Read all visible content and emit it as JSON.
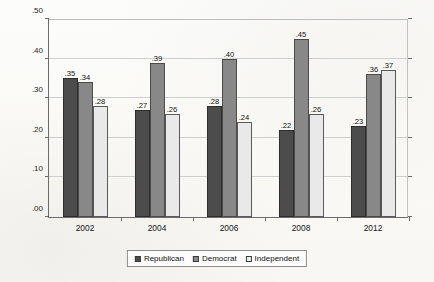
{
  "chart_data": {
    "type": "bar",
    "title": "",
    "xlabel": "",
    "ylabel": "Percent watching \"regularly\"",
    "categories": [
      "2002",
      "2004",
      "2006",
      "2008",
      "2012"
    ],
    "series": [
      {
        "name": "Republican",
        "color": "#4c4c4c",
        "values": [
          0.35,
          0.27,
          0.28,
          0.22,
          0.23
        ],
        "labels": [
          ".35",
          ".27",
          ".28",
          ".22",
          ".23"
        ]
      },
      {
        "name": "Democrat",
        "color": "#888888",
        "values": [
          0.34,
          0.39,
          0.4,
          0.45,
          0.36
        ],
        "labels": [
          ".34",
          ".39",
          ".40",
          ".45",
          ".36"
        ]
      },
      {
        "name": "Independent",
        "color": "#e9e9e9",
        "values": [
          0.28,
          0.26,
          0.24,
          0.26,
          0.37
        ],
        "labels": [
          ".28",
          ".26",
          ".24",
          ".26",
          ".37"
        ]
      }
    ],
    "ylim": [
      0.0,
      0.5
    ],
    "ytick_values": [
      0.0,
      0.1,
      0.2,
      0.3,
      0.4,
      0.5
    ],
    "ytick_labels": [
      ".00",
      ".10",
      ".20",
      ".30",
      ".40",
      ".50"
    ],
    "grid": true,
    "legend_position": "bottom-center"
  },
  "legend": {
    "items": [
      {
        "label": "Republican",
        "swatch": "series-republican"
      },
      {
        "label": "Democrat",
        "swatch": "series-democrat"
      },
      {
        "label": "Independent",
        "swatch": "series-independent"
      }
    ]
  }
}
